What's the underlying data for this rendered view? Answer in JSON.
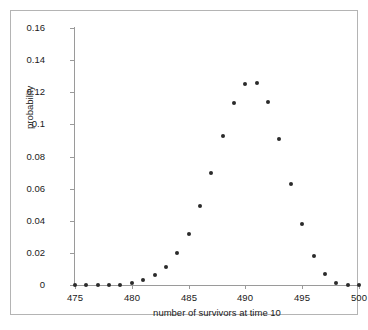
{
  "chart_data": {
    "type": "scatter",
    "title": "",
    "xlabel": "number of survivors at time 10",
    "ylabel": "probability",
    "xlim": [
      475,
      500
    ],
    "ylim": [
      0,
      0.16
    ],
    "grid": false,
    "legend": null,
    "xticks": [
      475,
      480,
      485,
      490,
      495,
      500
    ],
    "xtick_labels": [
      "475",
      "480",
      "485",
      "490",
      "495",
      "500"
    ],
    "yticks": [
      0,
      0.02,
      0.04,
      0.06,
      0.08,
      0.1,
      0.12,
      0.14,
      0.16
    ],
    "ytick_labels": [
      "0",
      "0.02",
      "0.04",
      "0.06",
      "0.08",
      "0.1",
      "0.12",
      "0.14",
      "0.16"
    ],
    "marker": "filled-circle",
    "marker_color": "#2b2b2b",
    "x": [
      475,
      476,
      477,
      478,
      479,
      480,
      481,
      482,
      483,
      484,
      485,
      486,
      487,
      488,
      489,
      490,
      491,
      492,
      493,
      494,
      495,
      496,
      497,
      498,
      499,
      500
    ],
    "values": [
      0.0,
      0.0,
      0.0,
      0.0,
      0.0,
      0.001,
      0.003,
      0.006,
      0.011,
      0.02,
      0.032,
      0.049,
      0.07,
      0.093,
      0.113,
      0.125,
      0.126,
      0.114,
      0.091,
      0.063,
      0.038,
      0.018,
      0.007,
      0.001,
      0.0,
      0.0
    ],
    "series": [
      {
        "name": "probability",
        "values": [
          0.0,
          0.0,
          0.0,
          0.0,
          0.0,
          0.001,
          0.003,
          0.006,
          0.011,
          0.02,
          0.032,
          0.049,
          0.07,
          0.093,
          0.113,
          0.125,
          0.126,
          0.114,
          0.091,
          0.063,
          0.038,
          0.018,
          0.007,
          0.001,
          0.0,
          0.0
        ]
      }
    ]
  },
  "colors": {
    "marker": "#2b2b2b",
    "axis": "#9a9a9a",
    "frame": "#b4b4b4",
    "text": "#1a1a1a",
    "background": "#ffffff"
  }
}
